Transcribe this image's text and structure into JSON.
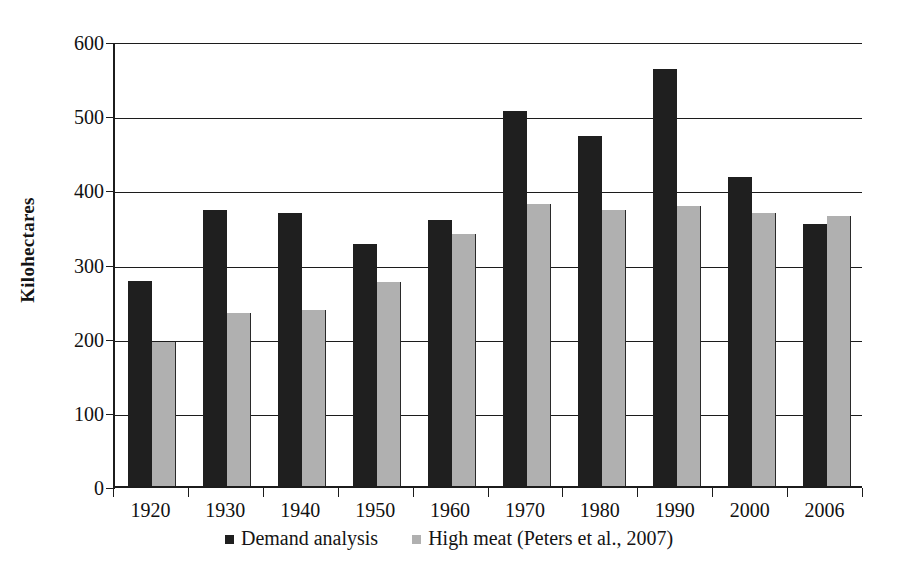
{
  "chart_data": {
    "type": "bar",
    "title": "",
    "xlabel": "",
    "ylabel": "Kilohectares",
    "categories": [
      "1920",
      "1930",
      "1940",
      "1950",
      "1960",
      "1970",
      "1980",
      "1990",
      "2000",
      "2006"
    ],
    "series": [
      {
        "name": "Demand analysis",
        "color": "#1f1f1f",
        "values": [
          276,
          372,
          368,
          326,
          358,
          505,
          472,
          562,
          416,
          353
        ]
      },
      {
        "name": "High meat (Peters et al., 2007)",
        "color": "#b0b0b0",
        "values": [
          194,
          233,
          237,
          275,
          340,
          380,
          372,
          378,
          368,
          364
        ]
      }
    ],
    "ylim": [
      0,
      600
    ],
    "yticks": [
      0,
      100,
      200,
      300,
      400,
      500,
      600
    ],
    "ytick_labels": [
      "0",
      "100",
      "200",
      "300",
      "400",
      "500",
      "600"
    ],
    "grid": "horizontal",
    "legend_position": "bottom-center"
  },
  "legend": {
    "items": [
      {
        "label": "Demand analysis",
        "marker": "square-dark-swatch"
      },
      {
        "label": "High meat (Peters et al., 2007)",
        "marker": "square-gray-swatch"
      }
    ]
  },
  "axis": {
    "y_title": "Kilohectares"
  }
}
